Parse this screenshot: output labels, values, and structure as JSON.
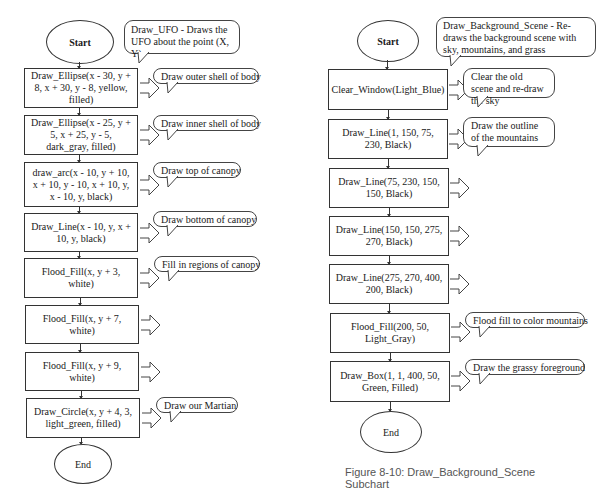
{
  "left_chart": {
    "start": "Start",
    "end": "End",
    "header_callout": "Draw_UFO - Draws the UFO about the point (X, Y)",
    "steps": [
      {
        "text": "Draw_Ellipse(x - 30, y + 8, x + 30, y - 8, yellow, filled)",
        "comment": "Draw outer shell of body"
      },
      {
        "text": "Draw_Ellipse(x - 25, y + 5, x + 25, y - 5, dark_gray, filled)",
        "comment": "Draw inner shell of body"
      },
      {
        "text": "draw_arc(x - 10, y + 10, x + 10, y - 10, x + 10, y, x - 10, y, black)",
        "comment": "Draw top of canopy"
      },
      {
        "text": "Draw_Line(x - 10, y, x + 10, y, black)",
        "comment": "Draw bottom of canopy"
      },
      {
        "text": "Flood_Fill(x, y + 3, white)",
        "comment": "Fill in regions of canopy"
      },
      {
        "text": "Flood_Fill(x, y + 7, white)",
        "comment": ""
      },
      {
        "text": "Flood_Fill(x, y + 9, white)",
        "comment": ""
      },
      {
        "text": "Draw_Circle(x, y + 4, 3, light_green, filled)",
        "comment": "Draw our Martian"
      }
    ]
  },
  "right_chart": {
    "start": "Start",
    "end": "End",
    "header_callout": "Draw_Background_Scene - Re-draws the background scene with sky, mountains, and grass",
    "steps": [
      {
        "text": "Clear_Window(Light_Blue)",
        "comment": "Clear the old scene and re-draw the sky"
      },
      {
        "text": "Draw_Line(1, 150, 75, 230, Black)",
        "comment": "Draw the outline of the mountains"
      },
      {
        "text": "Draw_Line(75, 230, 150, 150, Black)",
        "comment": ""
      },
      {
        "text": "Draw_Line(150, 150, 275, 270, Black)",
        "comment": ""
      },
      {
        "text": "Draw_Line(275, 270, 400, 200, Black)",
        "comment": ""
      },
      {
        "text": "Flood_Fill(200, 50, Light_Gray)",
        "comment": "Flood fill to color mountains"
      },
      {
        "text": "Draw_Box(1, 1, 400, 50, Green, Filled)",
        "comment": "Draw the grassy foreground"
      }
    ]
  },
  "caption": "Figure 8-10:  Draw_Background_Scene Subchart"
}
